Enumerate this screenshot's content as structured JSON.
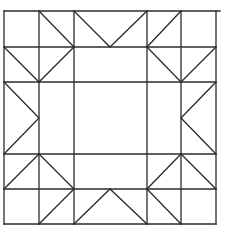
{
  "diagram": {
    "type": "quilt-block-line-drawing",
    "stroke_color": "#2b2b2b",
    "background": "#ffffff",
    "grid": {
      "x": [
        4,
        39,
        74,
        147,
        181,
        216
      ],
      "y": [
        11,
        47,
        82,
        154,
        189,
        224
      ]
    },
    "outer_top_extension_x": 220,
    "grid_lines": [
      {
        "name": "top-edge",
        "x1": 4,
        "y1": 11,
        "x2": 220,
        "y2": 11
      },
      {
        "name": "h-line-1",
        "x1": 4,
        "y1": 47,
        "x2": 216,
        "y2": 47
      },
      {
        "name": "h-line-2",
        "x1": 4,
        "y1": 82,
        "x2": 216,
        "y2": 82
      },
      {
        "name": "h-line-3",
        "x1": 4,
        "y1": 154,
        "x2": 216,
        "y2": 154
      },
      {
        "name": "h-line-4",
        "x1": 4,
        "y1": 189,
        "x2": 216,
        "y2": 189
      },
      {
        "name": "bottom-edge",
        "x1": 4,
        "y1": 224,
        "x2": 216,
        "y2": 224
      },
      {
        "name": "left-edge",
        "x1": 4,
        "y1": 11,
        "x2": 4,
        "y2": 224
      },
      {
        "name": "v-line-1",
        "x1": 39,
        "y1": 11,
        "x2": 39,
        "y2": 224
      },
      {
        "name": "v-line-2",
        "x1": 74,
        "y1": 11,
        "x2": 74,
        "y2": 224
      },
      {
        "name": "v-line-3",
        "x1": 147,
        "y1": 11,
        "x2": 147,
        "y2": 224
      },
      {
        "name": "v-line-4",
        "x1": 181,
        "y1": 11,
        "x2": 181,
        "y2": 224
      },
      {
        "name": "right-edge",
        "x1": 216,
        "y1": 11,
        "x2": 216,
        "y2": 224
      }
    ],
    "diagonals": [
      {
        "name": "r0c1-diag",
        "points": "39,11 74,47"
      },
      {
        "name": "r0c2-v-shape",
        "points": "74,11 110,47 147,11"
      },
      {
        "name": "r0c3-diag",
        "points": "147,47 181,11"
      },
      {
        "name": "r1c0-diag",
        "points": "4,47 39,82"
      },
      {
        "name": "r1c1-diag",
        "points": "39,82 74,47"
      },
      {
        "name": "r1c3-diag",
        "points": "147,47 181,82"
      },
      {
        "name": "r1c4-diag",
        "points": "181,82 216,47"
      },
      {
        "name": "r2c0-right-chevron",
        "points": "4,82 39,118 4,154"
      },
      {
        "name": "r2c4-left-chevron",
        "points": "216,82 181,118 216,154"
      },
      {
        "name": "r3c0-diag",
        "points": "4,189 39,154"
      },
      {
        "name": "r3c1-diag",
        "points": "39,154 74,189"
      },
      {
        "name": "r3c3-diag",
        "points": "147,189 181,154"
      },
      {
        "name": "r3c4-diag",
        "points": "181,154 216,189"
      },
      {
        "name": "r4c1-diag",
        "points": "39,224 74,189"
      },
      {
        "name": "r4c2-caret-shape",
        "points": "74,224 110,189 147,224"
      },
      {
        "name": "r4c3-diag",
        "points": "147,189 181,224"
      }
    ]
  }
}
